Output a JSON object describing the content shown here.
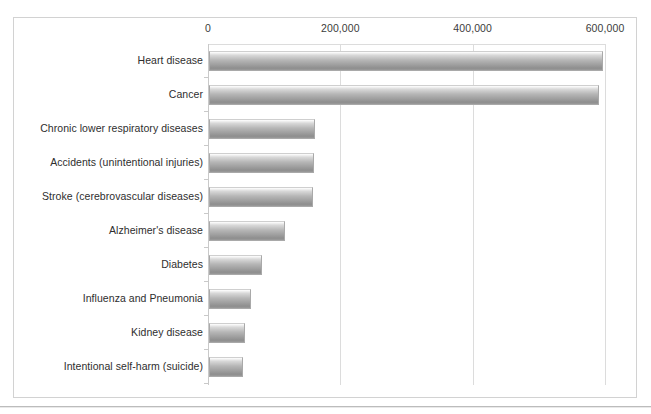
{
  "chart_data": {
    "type": "bar",
    "orientation": "horizontal",
    "title": "",
    "subtitle": "",
    "xlabel": "",
    "ylabel": "",
    "xlim": [
      0,
      600000
    ],
    "ylim": null,
    "grid": "vertical",
    "legend": "none",
    "xticks": [
      "0",
      "200,000",
      "400,000",
      "600,000"
    ],
    "xtick_values": [
      0,
      200000,
      400000,
      600000
    ],
    "categories": [
      "Heart disease",
      "Cancer",
      "Chronic lower respiratory diseases",
      "Accidents (unintentional injuries)",
      "Stroke (cerebrovascular diseases)",
      "Alzheimer's disease",
      "Diabetes",
      "Influenza and Pneumonia",
      "Kidney disease",
      "Intentional self-harm (suicide)"
    ],
    "values": [
      595000,
      590000,
      160000,
      158000,
      157000,
      115000,
      80000,
      63000,
      55000,
      52000
    ],
    "series": [
      {
        "name": "Deaths",
        "values": [
          595000,
          590000,
          160000,
          158000,
          157000,
          115000,
          80000,
          63000,
          55000,
          52000
        ]
      }
    ],
    "bar_color": "#a8a8a8",
    "bar_edge_color": "#a9a9a9",
    "grid_color": "#dcdcdc",
    "axis_color": "#c9c9c9",
    "text_color": "#2e2e2e",
    "background": "#ffffff"
  }
}
